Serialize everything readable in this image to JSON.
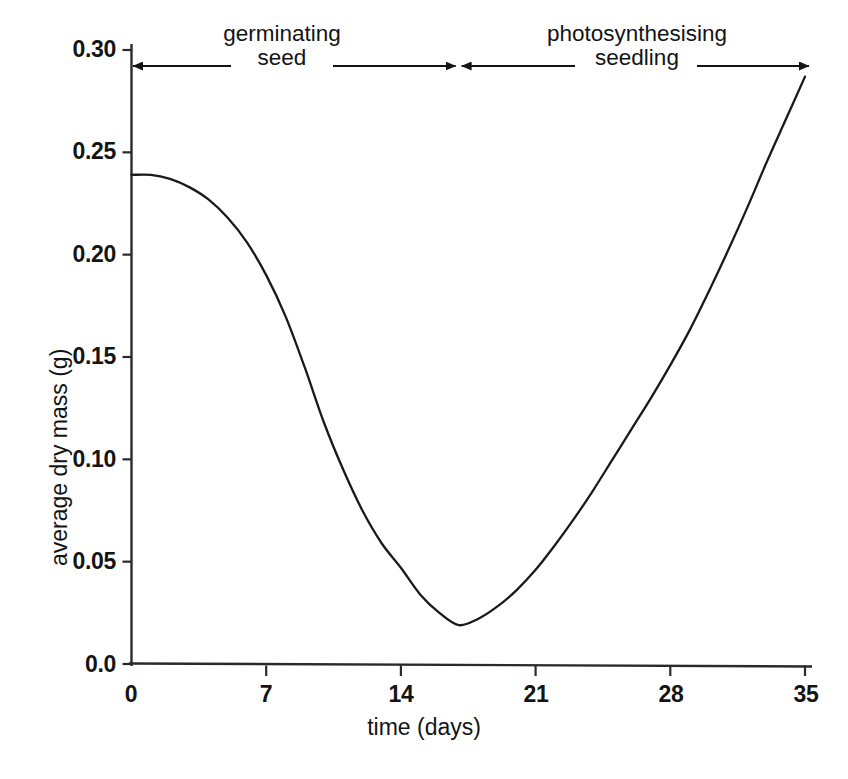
{
  "chart_data": {
    "type": "line",
    "title": "",
    "subtitle": "",
    "xlabel": "time (days)",
    "ylabel": "average dry mass (g)",
    "xlim": [
      0,
      35
    ],
    "ylim": [
      0.0,
      0.3
    ],
    "grid": false,
    "legend": null,
    "xticks": [
      0,
      7,
      14,
      21,
      28,
      35
    ],
    "xtick_labels": [
      "0",
      "7",
      "14",
      "21",
      "28",
      "35"
    ],
    "yticks": [
      0.0,
      0.05,
      0.1,
      0.15,
      0.2,
      0.25,
      0.3
    ],
    "ytick_labels": [
      "0.0",
      "0.05",
      "0.10",
      "0.15",
      "0.20",
      "0.25",
      "0.30"
    ],
    "series": [
      {
        "name": "average dry mass",
        "color": "#1a1a1a",
        "x": [
          0,
          1,
          2,
          3,
          4,
          5,
          6,
          7,
          8,
          9,
          10,
          11,
          12,
          13,
          14,
          15,
          16,
          17,
          18,
          19,
          20,
          21,
          22,
          23,
          24,
          25,
          26,
          27,
          28,
          29,
          30,
          31,
          32,
          33,
          34,
          35
        ],
        "values": [
          0.239,
          0.239,
          0.237,
          0.233,
          0.227,
          0.218,
          0.206,
          0.19,
          0.17,
          0.145,
          0.118,
          0.095,
          0.075,
          0.059,
          0.047,
          0.034,
          0.025,
          0.019,
          0.022,
          0.028,
          0.036,
          0.046,
          0.058,
          0.071,
          0.085,
          0.1,
          0.115,
          0.13,
          0.146,
          0.163,
          0.182,
          0.202,
          0.223,
          0.245,
          0.266,
          0.287
        ]
      }
    ],
    "annotations": [
      {
        "id": "germinating-seed",
        "label_line1": "germinating",
        "label_line2": "seed",
        "x_start": 0,
        "x_end": 17,
        "arrow": "double"
      },
      {
        "id": "photosynthesising-seedling",
        "label_line1": "photosynthesising",
        "label_line2": "seedling",
        "x_start": 17,
        "x_end": 35,
        "arrow": "double"
      }
    ],
    "phase_boundary_day": 17,
    "minimum_point": {
      "x": 17,
      "y": 0.019
    },
    "start_point": {
      "x": 0,
      "y": 0.239
    },
    "end_point": {
      "x": 35,
      "y": 0.287
    }
  },
  "colors": {
    "background": "#ffffff",
    "ink": "#1a1a1a",
    "axis": "#2a2a2a"
  }
}
